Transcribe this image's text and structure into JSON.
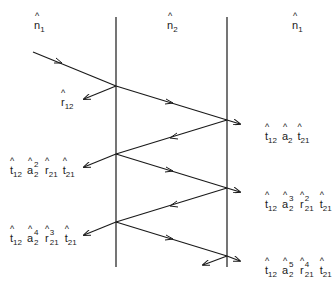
{
  "media": {
    "labels": {
      "left": {
        "symbol": "n",
        "sub": "1"
      },
      "middle": {
        "symbol": "n",
        "sub": "2"
      },
      "right": {
        "symbol": "n",
        "sub": "1"
      }
    }
  },
  "reflection_label": {
    "symbol": "r",
    "sub": "12"
  },
  "left_exit_terms": [
    {
      "parts": [
        {
          "symbol": "t",
          "sub": "12"
        },
        {
          "symbol": "a",
          "sup": "2",
          "sub": "2"
        },
        {
          "symbol": "r",
          "sub": "21"
        },
        {
          "symbol": "t",
          "sub": "21"
        }
      ]
    },
    {
      "parts": [
        {
          "symbol": "t",
          "sub": "12"
        },
        {
          "symbol": "a",
          "sup": "4",
          "sub": "2"
        },
        {
          "symbol": "r",
          "sup": "3",
          "sub": "21"
        },
        {
          "symbol": "t",
          "sub": "21"
        }
      ]
    }
  ],
  "right_exit_terms": [
    {
      "parts": [
        {
          "symbol": "t",
          "sub": "12"
        },
        {
          "symbol": "a",
          "sub": "2"
        },
        {
          "symbol": "t",
          "sub": "21"
        }
      ]
    },
    {
      "parts": [
        {
          "symbol": "t",
          "sub": "12"
        },
        {
          "symbol": "a",
          "sup": "3",
          "sub": "2"
        },
        {
          "symbol": "r",
          "sup": "2",
          "sub": "21"
        },
        {
          "symbol": "t",
          "sub": "21"
        }
      ]
    },
    {
      "parts": [
        {
          "symbol": "t",
          "sub": "12"
        },
        {
          "symbol": "a",
          "sup": "5",
          "sub": "2"
        },
        {
          "symbol": "r",
          "sup": "4",
          "sub": "21"
        },
        {
          "symbol": "t",
          "sub": "21"
        }
      ]
    }
  ],
  "colors": {
    "line": "#1a1a1a",
    "background": "#ffffff"
  }
}
